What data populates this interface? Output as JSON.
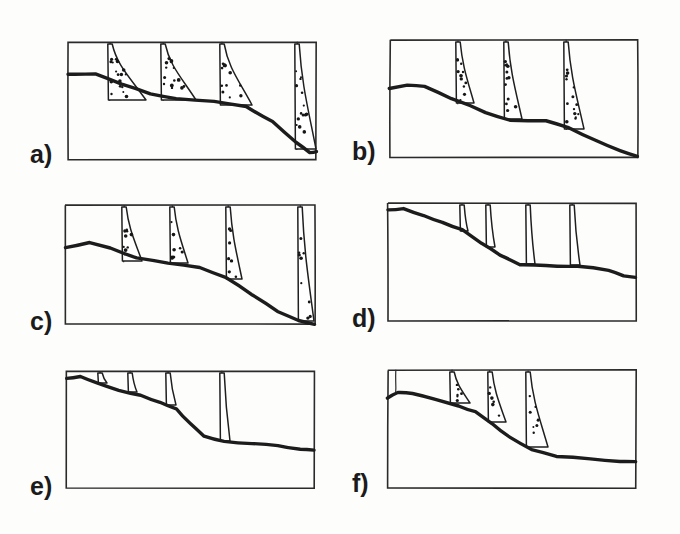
{
  "figure": {
    "background_color": "#fdfdfc",
    "ink_color": "#1b1b1b",
    "panel_count": 6,
    "columns": 2,
    "rows": 3
  },
  "chart_data": {
    "type": "diagram",
    "xlabel": "",
    "ylabel": "",
    "grid": false,
    "legend": "none",
    "panels": [
      {
        "label": "a)",
        "label_x": 30,
        "label_y": 163,
        "frame": {
          "x": 68,
          "y": 42,
          "w": 248,
          "h": 118
        },
        "ground_profile": [
          [
            68,
            74
          ],
          [
            96,
            74
          ],
          [
            122,
            84
          ],
          [
            150,
            94
          ],
          [
            176,
            99
          ],
          [
            214,
            101
          ],
          [
            246,
            107
          ],
          [
            272,
            122
          ],
          [
            296,
            143
          ],
          [
            310,
            152
          ],
          [
            316,
            152
          ]
        ],
        "gullies": [
          {
            "x": 110,
            "top": 42,
            "bottom": 101
          },
          {
            "x": 163,
            "top": 42,
            "bottom": 101
          },
          {
            "x": 222,
            "top": 42,
            "bottom": 103
          },
          {
            "x": 297,
            "top": 42,
            "bottom": 150
          }
        ],
        "wedges": [
          {
            "apex_x": 110,
            "apex_y": 44,
            "toe_x": 146,
            "toe_y": 101,
            "base_y": 101,
            "stipple": true,
            "dots": 18
          },
          {
            "apex_x": 163,
            "apex_y": 44,
            "toe_x": 196,
            "toe_y": 101,
            "base_y": 101,
            "stipple": true,
            "dots": 14
          },
          {
            "apex_x": 222,
            "apex_y": 44,
            "toe_x": 252,
            "toe_y": 106,
            "base_y": 106,
            "stipple": true,
            "dots": 12
          },
          {
            "apex_x": 297,
            "apex_y": 44,
            "toe_x": 316,
            "toe_y": 150,
            "base_y": 150,
            "stipple": true,
            "dots": 14
          }
        ],
        "wedge_count": 4,
        "fill_style": "stippled",
        "description": "Large stippled wedges; slope descends to bottom-right corner"
      },
      {
        "label": "b)",
        "label_x": 352,
        "label_y": 160,
        "frame": {
          "x": 390,
          "y": 40,
          "w": 248,
          "h": 117
        },
        "ground_profile": [
          [
            390,
            89
          ],
          [
            408,
            85
          ],
          [
            424,
            86
          ],
          [
            452,
            98
          ],
          [
            486,
            112
          ],
          [
            510,
            120
          ],
          [
            546,
            120
          ],
          [
            568,
            128
          ],
          [
            596,
            141
          ],
          [
            620,
            151
          ],
          [
            638,
            157
          ]
        ],
        "gullies": [
          {
            "x": 458,
            "top": 40,
            "bottom": 104
          },
          {
            "x": 506,
            "top": 40,
            "bottom": 120
          },
          {
            "x": 566,
            "top": 40,
            "bottom": 130
          }
        ],
        "wedges": [
          {
            "apex_x": 458,
            "apex_y": 42,
            "toe_x": 474,
            "toe_y": 104,
            "base_y": 104,
            "stipple": true,
            "dots": 12
          },
          {
            "apex_x": 506,
            "apex_y": 42,
            "toe_x": 522,
            "toe_y": 120,
            "base_y": 120,
            "stipple": true,
            "dots": 12
          },
          {
            "apex_x": 566,
            "apex_y": 42,
            "toe_x": 584,
            "toe_y": 130,
            "base_y": 130,
            "stipple": true,
            "dots": 14
          }
        ],
        "wedge_count": 3,
        "fill_style": "stippled",
        "description": "Three elongated stippled wedges on a smooth descending slope"
      },
      {
        "label": "c)",
        "label_x": 30,
        "label_y": 330,
        "frame": {
          "x": 65,
          "y": 205,
          "w": 250,
          "h": 119
        },
        "ground_profile": [
          [
            65,
            247
          ],
          [
            90,
            243
          ],
          [
            110,
            248
          ],
          [
            136,
            258
          ],
          [
            168,
            263
          ],
          [
            200,
            267
          ],
          [
            226,
            277
          ],
          [
            252,
            294
          ],
          [
            278,
            312
          ],
          [
            298,
            321
          ],
          [
            315,
            324
          ]
        ],
        "gullies": [
          {
            "x": 124,
            "top": 205,
            "bottom": 262
          },
          {
            "x": 172,
            "top": 205,
            "bottom": 264
          },
          {
            "x": 228,
            "top": 205,
            "bottom": 280
          },
          {
            "x": 300,
            "top": 205,
            "bottom": 322
          }
        ],
        "wedges": [
          {
            "apex_x": 124,
            "apex_y": 207,
            "toe_x": 142,
            "toe_y": 262,
            "base_y": 262,
            "stipple": true,
            "dots": 9
          },
          {
            "apex_x": 172,
            "apex_y": 207,
            "toe_x": 188,
            "toe_y": 264,
            "base_y": 264,
            "stipple": true,
            "dots": 8
          },
          {
            "apex_x": 228,
            "apex_y": 207,
            "toe_x": 242,
            "toe_y": 280,
            "base_y": 280,
            "stipple": true,
            "dots": 7
          },
          {
            "apex_x": 300,
            "apex_y": 207,
            "toe_x": 314,
            "toe_y": 322,
            "base_y": 322,
            "stipple": true,
            "dots": 9
          }
        ],
        "wedge_count": 4,
        "fill_style": "stippled-sparse",
        "description": "Four narrow tapered wedges with sparse stipple"
      },
      {
        "label": "d)",
        "label_x": 352,
        "label_y": 327,
        "frame": {
          "x": 388,
          "y": 203,
          "w": 248,
          "h": 118
        },
        "ground_profile": [
          [
            388,
            210
          ],
          [
            404,
            209
          ],
          [
            424,
            216
          ],
          [
            442,
            222
          ],
          [
            462,
            230
          ],
          [
            482,
            244
          ],
          [
            500,
            255
          ],
          [
            520,
            264
          ],
          [
            546,
            266
          ],
          [
            578,
            266
          ],
          [
            608,
            270
          ],
          [
            624,
            276
          ],
          [
            636,
            278
          ]
        ],
        "gullies": [
          {
            "x": 462,
            "top": 203,
            "bottom": 232
          },
          {
            "x": 488,
            "top": 203,
            "bottom": 248
          },
          {
            "x": 528,
            "top": 203,
            "bottom": 265
          },
          {
            "x": 572,
            "top": 203,
            "bottom": 266
          }
        ],
        "wedges": [
          {
            "apex_x": 462,
            "apex_y": 205,
            "toe_x": 468,
            "toe_y": 232,
            "base_y": 232,
            "stipple": false,
            "dots": 0
          },
          {
            "apex_x": 488,
            "apex_y": 205,
            "toe_x": 495,
            "toe_y": 248,
            "base_y": 248,
            "stipple": false,
            "dots": 0
          },
          {
            "apex_x": 528,
            "apex_y": 205,
            "toe_x": 535,
            "toe_y": 265,
            "base_y": 265,
            "stipple": false,
            "dots": 0
          },
          {
            "apex_x": 572,
            "apex_y": 205,
            "toe_x": 580,
            "toe_y": 266,
            "base_y": 266,
            "stipple": false,
            "dots": 0
          }
        ],
        "wedge_count": 4,
        "fill_style": "unfilled",
        "description": "Four gully lines with tiny unfilled lobes at their bases"
      },
      {
        "label": "e)",
        "label_x": 30,
        "label_y": 495,
        "frame": {
          "x": 66,
          "y": 371,
          "w": 248,
          "h": 117
        },
        "ground_profile": [
          [
            66,
            378
          ],
          [
            80,
            377
          ],
          [
            96,
            382
          ],
          [
            118,
            390
          ],
          [
            140,
            396
          ],
          [
            160,
            402
          ],
          [
            176,
            409
          ],
          [
            190,
            424
          ],
          [
            204,
            436
          ],
          [
            224,
            442
          ],
          [
            252,
            443
          ],
          [
            278,
            446
          ],
          [
            300,
            449
          ],
          [
            314,
            450
          ]
        ],
        "gullies": [
          {
            "x": 100,
            "top": 371,
            "bottom": 384
          },
          {
            "x": 130,
            "top": 371,
            "bottom": 393
          },
          {
            "x": 168,
            "top": 371,
            "bottom": 406
          },
          {
            "x": 222,
            "top": 371,
            "bottom": 442
          }
        ],
        "wedges": [
          {
            "apex_x": 100,
            "apex_y": 373,
            "toe_x": 107,
            "toe_y": 384,
            "base_y": 384,
            "stipple": false,
            "dots": 0
          },
          {
            "apex_x": 130,
            "apex_y": 373,
            "toe_x": 137,
            "toe_y": 393,
            "base_y": 393,
            "stipple": false,
            "dots": 0
          },
          {
            "apex_x": 168,
            "apex_y": 373,
            "toe_x": 176,
            "toe_y": 406,
            "base_y": 406,
            "stipple": false,
            "dots": 0
          },
          {
            "apex_x": 222,
            "apex_y": 373,
            "toe_x": 230,
            "toe_y": 442,
            "base_y": 442,
            "stipple": false,
            "dots": 0
          }
        ],
        "wedge_count": 4,
        "fill_style": "unfilled",
        "description": "Four gully lines ending in small unfilled teardrop lobes"
      },
      {
        "label": "f)",
        "label_x": 352,
        "label_y": 492,
        "frame": {
          "x": 388,
          "y": 370,
          "w": 248,
          "h": 118
        },
        "ground_profile": [
          [
            388,
            398
          ],
          [
            398,
            392
          ],
          [
            412,
            393
          ],
          [
            436,
            400
          ],
          [
            458,
            406
          ],
          [
            476,
            412
          ],
          [
            492,
            424
          ],
          [
            510,
            438
          ],
          [
            532,
            450
          ],
          [
            556,
            456
          ],
          [
            590,
            459
          ],
          [
            620,
            461
          ],
          [
            636,
            462
          ]
        ],
        "gullies": [
          {
            "x": 396,
            "top": 370,
            "bottom": 394
          },
          {
            "x": 452,
            "top": 370,
            "bottom": 404
          },
          {
            "x": 490,
            "top": 370,
            "bottom": 423
          },
          {
            "x": 528,
            "top": 370,
            "bottom": 448
          }
        ],
        "wedges": [
          {
            "apex_x": 452,
            "apex_y": 372,
            "toe_x": 470,
            "toe_y": 404,
            "base_y": 404,
            "stipple": true,
            "dots": 6
          },
          {
            "apex_x": 490,
            "apex_y": 372,
            "toe_x": 506,
            "toe_y": 423,
            "base_y": 423,
            "stipple": true,
            "dots": 6
          },
          {
            "apex_x": 528,
            "apex_y": 372,
            "toe_x": 548,
            "toe_y": 448,
            "base_y": 448,
            "stipple": true,
            "dots": 8
          }
        ],
        "wedge_count": 3,
        "fill_style": "stippled-small",
        "description": "Plain line at left plus three small stippled triangular deposits"
      }
    ]
  }
}
